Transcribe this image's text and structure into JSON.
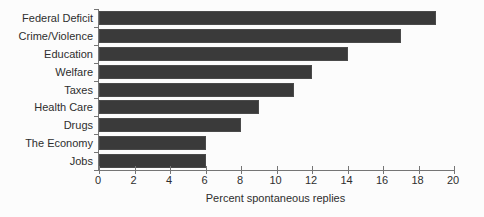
{
  "chart_data": {
    "type": "bar",
    "orientation": "horizontal",
    "title": "",
    "categories": [
      "Federal Deficit",
      "Crime/Violence",
      "Education",
      "Welfare",
      "Taxes",
      "Health Care",
      "Drugs",
      "The Economy",
      "Jobs"
    ],
    "values": [
      19,
      17,
      14,
      12,
      11,
      9,
      8,
      6,
      6
    ],
    "xlabel": "Percent spontaneous replies",
    "ylabel": "",
    "xlim": [
      0,
      20
    ],
    "x_ticks": [
      0,
      2,
      4,
      6,
      8,
      10,
      12,
      14,
      16,
      18,
      20
    ],
    "grid": false,
    "legend": "none",
    "bar_color": "#3a3a3a",
    "axis_color": "#757575",
    "text_color": "#2e2e2e",
    "background_color": "#fcfcfc"
  }
}
